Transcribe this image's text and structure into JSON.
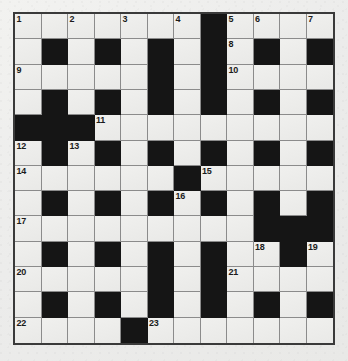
{
  "puzzle": {
    "type": "crossword-grid",
    "columns": 12,
    "rows": 12,
    "cell_size_px": 26.8,
    "colors": {
      "background": "#efefed",
      "white_cell": "#ececeb",
      "black_cell": "#151515",
      "grid_line": "#8b8b8b",
      "outer_border": "#3a3a3a",
      "number_text": "#1b1b1b"
    },
    "grid": [
      [
        "W",
        "W",
        "W",
        "W",
        "W",
        "W",
        "W",
        "B",
        "W",
        "W",
        "W",
        "W"
      ],
      [
        "W",
        "B",
        "W",
        "B",
        "W",
        "B",
        "W",
        "B",
        "W",
        "B",
        "W",
        "B"
      ],
      [
        "W",
        "W",
        "W",
        "W",
        "W",
        "B",
        "W",
        "B",
        "W",
        "W",
        "W",
        "W"
      ],
      [
        "W",
        "B",
        "W",
        "B",
        "W",
        "B",
        "W",
        "B",
        "W",
        "B",
        "W",
        "B"
      ],
      [
        "B",
        "B",
        "B",
        "W",
        "W",
        "W",
        "W",
        "W",
        "W",
        "W",
        "W",
        "W"
      ],
      [
        "W",
        "B",
        "W",
        "B",
        "W",
        "B",
        "W",
        "B",
        "W",
        "B",
        "W",
        "B"
      ],
      [
        "W",
        "W",
        "W",
        "W",
        "W",
        "W",
        "B",
        "W",
        "W",
        "W",
        "W",
        "W"
      ],
      [
        "W",
        "B",
        "W",
        "B",
        "W",
        "B",
        "W",
        "B",
        "W",
        "B",
        "W",
        "B"
      ],
      [
        "W",
        "W",
        "W",
        "W",
        "W",
        "W",
        "W",
        "W",
        "W",
        "B",
        "B",
        "B"
      ],
      [
        "W",
        "B",
        "W",
        "B",
        "W",
        "B",
        "W",
        "B",
        "W",
        "W",
        "B",
        "W"
      ],
      [
        "W",
        "W",
        "W",
        "W",
        "W",
        "B",
        "W",
        "B",
        "W",
        "W",
        "W",
        "W"
      ],
      [
        "W",
        "B",
        "W",
        "B",
        "W",
        "B",
        "W",
        "B",
        "W",
        "B",
        "W",
        "B"
      ],
      [
        "W",
        "W",
        "W",
        "W",
        "B",
        "W",
        "W",
        "W",
        "W",
        "W",
        "W",
        "W"
      ]
    ],
    "numbers": [
      {
        "n": "1",
        "row": 0,
        "col": 0
      },
      {
        "n": "2",
        "row": 0,
        "col": 2
      },
      {
        "n": "3",
        "row": 0,
        "col": 4
      },
      {
        "n": "4",
        "row": 0,
        "col": 6
      },
      {
        "n": "5",
        "row": 0,
        "col": 8
      },
      {
        "n": "6",
        "row": 0,
        "col": 9
      },
      {
        "n": "7",
        "row": 0,
        "col": 11
      },
      {
        "n": "8",
        "row": 1,
        "col": 8
      },
      {
        "n": "9",
        "row": 2,
        "col": 0
      },
      {
        "n": "10",
        "row": 2,
        "col": 8
      },
      {
        "n": "11",
        "row": 4,
        "col": 3
      },
      {
        "n": "12",
        "row": 5,
        "col": 0
      },
      {
        "n": "13",
        "row": 5,
        "col": 2
      },
      {
        "n": "14",
        "row": 6,
        "col": 0
      },
      {
        "n": "15",
        "row": 6,
        "col": 7
      },
      {
        "n": "16",
        "row": 7,
        "col": 6
      },
      {
        "n": "17",
        "row": 8,
        "col": 0
      },
      {
        "n": "18",
        "row": 9,
        "col": 9
      },
      {
        "n": "19",
        "row": 9,
        "col": 11
      },
      {
        "n": "20",
        "row": 10,
        "col": 0
      },
      {
        "n": "21",
        "row": 10,
        "col": 8
      },
      {
        "n": "22",
        "row": 12,
        "col": 0
      },
      {
        "n": "23",
        "row": 12,
        "col": 5
      }
    ]
  }
}
